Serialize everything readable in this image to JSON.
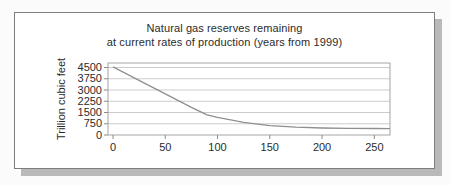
{
  "chart_data": {
    "type": "line",
    "title": "Natural gas reserves remaining at current rates of production (years from 1999)",
    "title_line1": "Natural gas reserves remaining",
    "title_line2": "at current rates of production (years from 1999)",
    "xlabel": "",
    "ylabel": "Trillion cubic feet",
    "series_name": "Natural gas reserves remaining",
    "x": [
      0,
      25,
      50,
      75,
      90,
      100,
      110,
      125,
      150,
      175,
      200,
      225,
      250,
      265
    ],
    "y": [
      4550,
      3650,
      2750,
      1850,
      1350,
      1180,
      1050,
      850,
      620,
      520,
      470,
      445,
      430,
      425
    ],
    "x_ticks": [
      0,
      50,
      100,
      150,
      200,
      250
    ],
    "y_ticks": [
      0,
      750,
      1500,
      2250,
      3000,
      3750,
      4500
    ],
    "xlim": [
      0,
      265
    ],
    "ylim": [
      0,
      4800
    ],
    "grid": "horizontal-only",
    "legend": "none",
    "colors": {
      "line": "#8f8f8f",
      "gridline": "#cccccc",
      "frame": "#a5a5a5",
      "tick": "#8a8a8a",
      "text": "#2b2b2b",
      "card_border": "#7d7d7d",
      "card_shadow": "#b9b9b9",
      "background": "#ffffff"
    }
  }
}
